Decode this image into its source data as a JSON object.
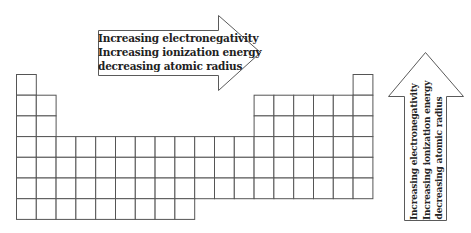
{
  "diagram": {
    "horizontal_arrow": {
      "direction": "right",
      "lines": [
        "Increasing electronegativity",
        "Increasing ionization energy",
        "decreasing atomic radius"
      ]
    },
    "vertical_arrow": {
      "direction": "up",
      "lines": [
        "Increasing electronegativity",
        "Increasing ionization energy",
        "decreasing atomic radius"
      ]
    },
    "periodic_table": {
      "columns": 18,
      "rows": 7,
      "row_layout": [
        {
          "row": 1,
          "columns": [
            1,
            18
          ]
        },
        {
          "row": 2,
          "columns": [
            1,
            2,
            13,
            14,
            15,
            16,
            17,
            18
          ]
        },
        {
          "row": 3,
          "columns": [
            1,
            2,
            13,
            14,
            15,
            16,
            17,
            18
          ]
        },
        {
          "row": 4,
          "columns": [
            1,
            2,
            3,
            4,
            5,
            6,
            7,
            8,
            9,
            10,
            11,
            12,
            13,
            14,
            15,
            16,
            17,
            18
          ]
        },
        {
          "row": 5,
          "columns": [
            1,
            2,
            3,
            4,
            5,
            6,
            7,
            8,
            9,
            10,
            11,
            12,
            13,
            14,
            15,
            16,
            17,
            18
          ]
        },
        {
          "row": 6,
          "columns": [
            1,
            2,
            3,
            4,
            5,
            6,
            7,
            8,
            9,
            10,
            11,
            12,
            13,
            14,
            15,
            16,
            17,
            18
          ]
        },
        {
          "row": 7,
          "columns": [
            1,
            2,
            3,
            4,
            5,
            6,
            7,
            8,
            9
          ]
        }
      ]
    },
    "colors": {
      "background": "#ffffff",
      "grid_line": "#555555",
      "arrow_outline": "#5a5a5a",
      "text": "#222222"
    }
  }
}
